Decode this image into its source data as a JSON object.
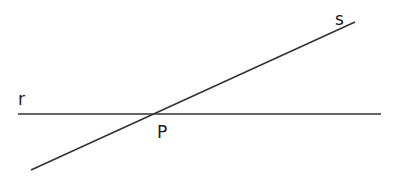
{
  "diagram": {
    "labels": {
      "line_r": "r",
      "line_s": "s",
      "point_p": "P"
    },
    "colors": {
      "line": "#333333",
      "text": "#1a1a1a",
      "background": "#ffffff"
    }
  }
}
